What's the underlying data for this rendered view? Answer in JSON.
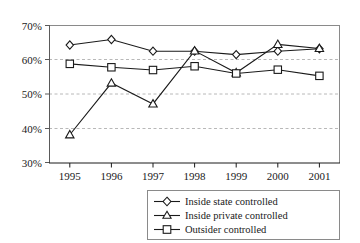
{
  "chart_data": {
    "type": "line",
    "title": "",
    "subtitle": "",
    "xlabel": "",
    "ylabel": "",
    "categories": [
      "1995",
      "1996",
      "1997",
      "1998",
      "1999",
      "2000",
      "2001"
    ],
    "ylim": [
      30,
      70
    ],
    "ytick_labels": [
      "30%",
      "40%",
      "50%",
      "60%",
      "70%"
    ],
    "ytick_values": [
      30,
      40,
      50,
      60,
      70
    ],
    "grid": "horizontal-dashed",
    "legend_position": "bottom-right",
    "series": [
      {
        "name": "Inside state controlled",
        "marker": "diamond",
        "values": [
          64.3,
          65.9,
          62.5,
          62.5,
          61.5,
          62.5,
          63.2
        ]
      },
      {
        "name": "Inside private controlled",
        "marker": "triangle",
        "values": [
          38.1,
          53.2,
          47.1,
          62.6,
          56.2,
          64.5,
          63.3
        ]
      },
      {
        "name": "Outsider controlled",
        "marker": "square",
        "values": [
          58.8,
          57.8,
          57.0,
          58.1,
          56.0,
          57.1,
          55.3
        ]
      }
    ]
  },
  "style": {
    "line_color": "#1a1a1a",
    "grid_color": "#b8b8b8",
    "frame_color": "#8a8a8a",
    "axis_color": "#1a1a1a",
    "marker_fill": "#ffffff",
    "background": "#ffffff"
  }
}
